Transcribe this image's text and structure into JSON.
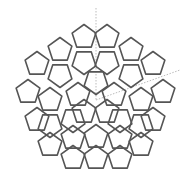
{
  "diagram": {
    "type": "pentagon-tiling",
    "stroke_color": "#555555",
    "guide_color": "#aaaaaa",
    "center": [
      96,
      97
    ],
    "pentagon_radius": 12.5,
    "pentagons": [
      [
        84,
        37,
        0
      ],
      [
        107,
        37,
        0
      ],
      [
        60,
        50,
        0
      ],
      [
        131,
        50,
        0
      ],
      [
        37,
        64,
        0
      ],
      [
        153,
        64,
        0
      ],
      [
        28,
        92,
        0
      ],
      [
        163,
        92,
        0
      ],
      [
        37,
        120,
        0
      ],
      [
        153,
        120,
        0
      ],
      [
        50,
        145,
        0
      ],
      [
        141,
        145,
        0
      ],
      [
        73,
        158,
        0
      ],
      [
        96,
        158,
        0
      ],
      [
        120,
        158,
        0
      ],
      [
        84,
        62,
        180
      ],
      [
        107,
        62,
        180
      ],
      [
        60,
        75,
        180
      ],
      [
        131,
        75,
        180
      ],
      [
        50,
        100,
        0
      ],
      [
        141,
        100,
        0
      ],
      [
        73,
        120,
        180
      ],
      [
        120,
        120,
        180
      ],
      [
        96,
        137,
        0
      ],
      [
        96,
        82,
        180
      ],
      [
        78,
        95,
        0
      ],
      [
        114,
        95,
        0
      ],
      [
        84,
        112,
        0
      ],
      [
        107,
        112,
        0
      ],
      [
        50,
        125,
        180
      ],
      [
        141,
        125,
        180
      ],
      [
        73,
        138,
        0
      ],
      [
        120,
        138,
        0
      ]
    ],
    "guides": [
      [
        [
          96,
          8
        ],
        [
          96,
          100
        ]
      ],
      [
        [
          96,
          100
        ],
        [
          180,
          70
        ]
      ]
    ]
  }
}
